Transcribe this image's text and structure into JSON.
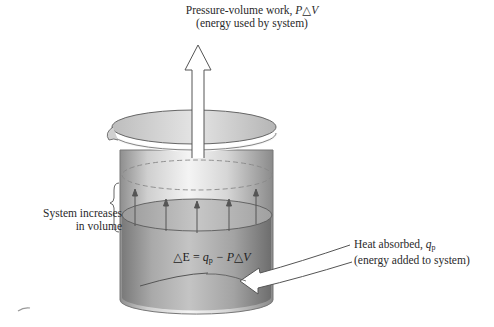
{
  "figure": {
    "work_label": {
      "line1": "Pressure-volume work, ",
      "line1_symbol": "P△V",
      "line2": "(energy used by system)"
    },
    "volume_label": {
      "line1": "System increases",
      "line2": "in volume"
    },
    "heat_label": {
      "line1": "Heat absorbed, ",
      "line1_symbol": "q",
      "line1_subscript": "p",
      "line2": "(energy added to system)"
    },
    "equation": {
      "lhs": "△E = ",
      "q": "q",
      "q_sub": "p",
      "rhs": " − P△V"
    }
  },
  "colors": {
    "beaker_light": "#f2f2f2",
    "beaker_mid": "#c8c8c8",
    "beaker_dark": "#8a8a8a",
    "liquid_light": "#b8b8b8",
    "liquid_dark": "#7c7c7c",
    "line": "#555555",
    "arrow_fill": "#ffffff"
  }
}
